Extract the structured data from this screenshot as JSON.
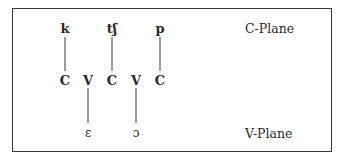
{
  "diagram": {
    "planes": {
      "c_plane_label": "C-Plane",
      "v_plane_label": "V-Plane"
    },
    "skeleton": [
      "C",
      "V",
      "C",
      "V",
      "C"
    ],
    "c_plane_segments": [
      {
        "symbol": "k",
        "slot_index": 0
      },
      {
        "symbol": "tʃ",
        "slot_index": 2
      },
      {
        "symbol": "p",
        "slot_index": 4
      }
    ],
    "v_plane_segments": [
      {
        "symbol": "ε",
        "slot_index": 1
      },
      {
        "symbol": "ɔ",
        "slot_index": 3
      }
    ]
  }
}
